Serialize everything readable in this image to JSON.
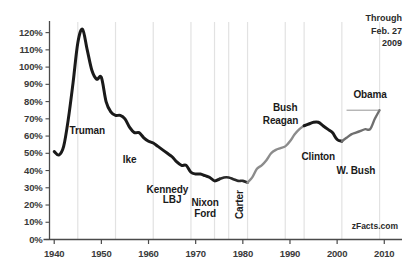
{
  "chart_data": {
    "type": "line",
    "title": "",
    "subtitle": "",
    "xlabel": "",
    "ylabel": "",
    "xlim": [
      1939,
      2011
    ],
    "ylim": [
      0,
      125
    ],
    "grid": "vertical-only",
    "legend_position": "none",
    "y_ticks": [
      "0%",
      "10%",
      "20%",
      "30%",
      "40%",
      "50%",
      "60%",
      "70%",
      "80%",
      "90%",
      "100%",
      "110%",
      "120%"
    ],
    "y_tick_values": [
      0,
      10,
      20,
      30,
      40,
      50,
      60,
      70,
      80,
      90,
      100,
      110,
      120
    ],
    "x_ticks": [
      "1940",
      "1950",
      "1960",
      "1970",
      "1980",
      "1990",
      "2000",
      "2010"
    ],
    "x_tick_values": [
      1940,
      1950,
      1960,
      1970,
      1980,
      1990,
      2000,
      2010
    ],
    "gridline_years": [
      1945,
      1953,
      1961,
      1969,
      1974,
      1977,
      1981,
      1989,
      1993,
      2001,
      2009
    ],
    "series": [
      {
        "name": "Federal Debt as Percent of GDP",
        "x": [
          1940,
          1941,
          1942,
          1943,
          1944,
          1945,
          1946,
          1947,
          1948,
          1949,
          1950,
          1951,
          1952,
          1953,
          1954,
          1955,
          1956,
          1957,
          1958,
          1959,
          1960,
          1961,
          1962,
          1963,
          1964,
          1965,
          1966,
          1967,
          1968,
          1969,
          1970,
          1971,
          1972,
          1973,
          1974,
          1975,
          1976,
          1977,
          1978,
          1979,
          1980,
          1981,
          1982,
          1983,
          1984,
          1985,
          1986,
          1987,
          1988,
          1989,
          1990,
          1991,
          1992,
          1993,
          1994,
          1995,
          1996,
          1997,
          1998,
          1999,
          2000,
          2001,
          2002,
          2003,
          2004,
          2005,
          2006,
          2007,
          2008,
          2009
        ],
        "values": [
          51,
          49,
          54,
          70,
          91,
          114,
          122,
          110,
          98,
          93,
          94,
          80,
          74,
          72,
          72,
          70,
          65,
          62,
          62,
          59,
          57,
          56,
          54,
          52,
          50,
          48,
          45,
          43,
          43,
          39,
          38,
          38,
          37,
          36,
          34,
          35,
          36,
          36,
          35,
          34,
          34,
          33,
          36,
          41,
          43,
          46,
          50,
          52,
          53,
          54,
          57,
          61,
          64,
          66,
          67,
          68,
          68,
          66,
          64,
          62,
          58,
          57,
          59,
          61,
          62,
          63,
          64,
          64,
          70,
          75
        ],
        "segments": [
          {
            "from": 1940,
            "to": 1975,
            "color": "#1a1a1a",
            "width": 3.0
          },
          {
            "from": 1975,
            "to": 1981,
            "color": "#2a2a2a",
            "width": 2.6
          },
          {
            "from": 1981,
            "to": 1993,
            "color": "#8c8c8c",
            "width": 2.4
          },
          {
            "from": 1993,
            "to": 2001,
            "color": "#1a1a1a",
            "width": 3.0
          },
          {
            "from": 2001,
            "to": 2009,
            "color": "#6f6f6f",
            "width": 2.4
          }
        ]
      }
    ],
    "annotations": [
      {
        "label": "Truman",
        "x": 1947,
        "y": 63,
        "rotation": 0
      },
      {
        "label": "Ike",
        "x": 1956,
        "y": 46,
        "rotation": 0
      },
      {
        "label": "Kennedy",
        "x": 1964,
        "y": 29,
        "rotation": 0
      },
      {
        "label": "LBJ",
        "x": 1965,
        "y": 23,
        "rotation": 0
      },
      {
        "label": "Nixon",
        "x": 1972,
        "y": 21,
        "rotation": 0
      },
      {
        "label": "Ford",
        "x": 1972,
        "y": 15,
        "rotation": 0
      },
      {
        "label": "Carter",
        "x": 1979,
        "y": 12,
        "rotation": -90
      },
      {
        "label": "Bush",
        "x": 1989,
        "y": 76,
        "rotation": 0
      },
      {
        "label": "Reagan",
        "x": 1988,
        "y": 69,
        "rotation": 0
      },
      {
        "label": "Clinton",
        "x": 1996,
        "y": 48,
        "rotation": 0
      },
      {
        "label": "W. Bush",
        "x": 2004,
        "y": 40,
        "rotation": 0
      },
      {
        "label": "Obama",
        "x": 2007,
        "y": 84,
        "rotation": 0
      }
    ],
    "obama_bracket": {
      "x_start": 2002,
      "x_end": 2009,
      "y": 75
    }
  },
  "note": {
    "line1": "Through",
    "line2": "Feb. 27",
    "line3": "2009"
  },
  "watermark": {
    "text": "zFacts.com"
  },
  "axis": {
    "y_labels": [
      "120%",
      "110%",
      "100%",
      "90%",
      "80%",
      "70%",
      "60%",
      "50%",
      "40%",
      "30%",
      "20%",
      "10%",
      "0%"
    ],
    "x_labels": [
      "1940",
      "1950",
      "1960",
      "1970",
      "1980",
      "1990",
      "2000",
      "2010"
    ]
  },
  "colors": {
    "axis": "#4a4a4a",
    "gridline": "#e2e2e2",
    "line_dark": "#1a1a1a",
    "line_gray": "#8c8c8c",
    "text": "#2b2b2b",
    "background": "#ffffff"
  }
}
